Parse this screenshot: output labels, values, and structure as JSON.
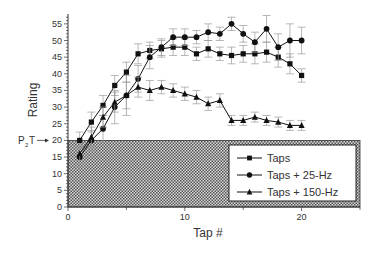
{
  "chart_data": {
    "type": "line",
    "title": "",
    "xlabel": "Tap #",
    "ylabel": "Rating",
    "xlim": [
      0,
      25
    ],
    "ylim": [
      0,
      58
    ],
    "xticks": [
      0,
      10,
      20
    ],
    "yticks": [
      0,
      5,
      10,
      15,
      20,
      25,
      30,
      35,
      40,
      45,
      50,
      55
    ],
    "grid": false,
    "legend_position": "lower right",
    "threshold": {
      "label": "P2T",
      "label_main": "P",
      "label_sub": "2",
      "label_tail": "T",
      "value": 20,
      "shaded_region": [
        0,
        20
      ],
      "pattern": "crosshatch"
    },
    "x": [
      1,
      2,
      3,
      4,
      5,
      6,
      7,
      8,
      9,
      10,
      11,
      12,
      13,
      14,
      15,
      16,
      17,
      18,
      19,
      20
    ],
    "series": [
      {
        "name": "Taps",
        "marker": "square",
        "values": [
          20,
          25.5,
          30.5,
          36.5,
          40.5,
          46,
          47,
          47.5,
          48,
          48,
          46,
          47.5,
          46,
          45.5,
          46,
          46,
          46.5,
          45,
          43,
          39.5
        ],
        "errors": [
          2.5,
          3,
          3,
          3,
          3,
          3,
          2.5,
          2.5,
          2.5,
          2.5,
          2,
          2.5,
          2,
          2.5,
          2.5,
          3,
          3,
          3,
          3,
          2
        ]
      },
      {
        "name": "Taps + 25-Hz",
        "marker": "circle",
        "values": [
          15,
          20,
          23.5,
          30,
          33.5,
          38.5,
          45,
          48,
          51,
          51,
          51,
          52.5,
          52,
          55,
          52,
          49.5,
          53.5,
          48,
          50,
          50
        ],
        "errors": [
          3,
          3,
          4,
          5,
          6,
          4,
          3.5,
          2.5,
          2.5,
          2.5,
          2,
          2.5,
          2,
          2,
          2.5,
          3,
          4,
          4,
          5,
          4
        ]
      },
      {
        "name": "Taps + 150-Hz",
        "marker": "triangle",
        "values": [
          16,
          21,
          27,
          31.5,
          33.5,
          36,
          35,
          36,
          35,
          34,
          33,
          31,
          32,
          26,
          26,
          27,
          26,
          25.5,
          24.5,
          24.5
        ],
        "errors": [
          3,
          3,
          3,
          3,
          4,
          3,
          3,
          2,
          2,
          2,
          2,
          2,
          2,
          1.5,
          1.5,
          1.5,
          1.5,
          1.5,
          1.5,
          1.5
        ]
      }
    ]
  }
}
